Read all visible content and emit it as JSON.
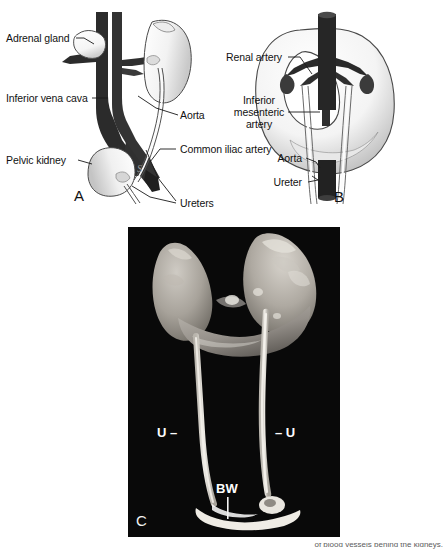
{
  "figure": {
    "caption_fragment": "of blood vessels behind the kidneys."
  },
  "panels": [
    {
      "id": "A",
      "letter": "A",
      "title": "pelvic-kidney-diagram",
      "labels": [
        {
          "name": "adrenal-gland",
          "text": "Adrenal gland"
        },
        {
          "name": "inferior-vena-cava",
          "text": "Inferior vena cava"
        },
        {
          "name": "pelvic-kidney",
          "text": "Pelvic kidney"
        },
        {
          "name": "aorta",
          "text": "Aorta"
        },
        {
          "name": "common-iliac-artery",
          "text": "Common iliac artery"
        },
        {
          "name": "ureters",
          "text": "Ureters"
        }
      ]
    },
    {
      "id": "B",
      "letter": "B",
      "title": "horseshoe-kidney-diagram",
      "labels": [
        {
          "name": "renal-artery",
          "text": "Renal artery"
        },
        {
          "name": "inferior-mesenteric-artery-line1",
          "text": "Inferior"
        },
        {
          "name": "inferior-mesenteric-artery-line2",
          "text": "mesenteric"
        },
        {
          "name": "inferior-mesenteric-artery-line3",
          "text": "artery"
        },
        {
          "name": "aorta",
          "text": "Aorta"
        },
        {
          "name": "ureter",
          "text": "Ureter"
        }
      ]
    },
    {
      "id": "C",
      "letter": "C",
      "title": "horseshoe-kidney-specimen-photograph",
      "labels": [
        {
          "name": "ureter-left-marker",
          "text": "U –"
        },
        {
          "name": "ureter-right-marker",
          "text": "– U"
        },
        {
          "name": "bladder-wall-marker",
          "text": "BW"
        }
      ]
    }
  ]
}
